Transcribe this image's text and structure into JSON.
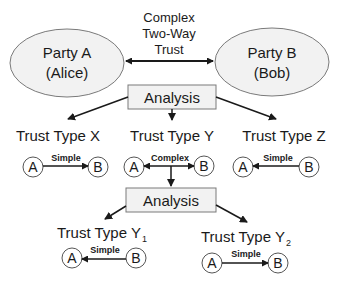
{
  "top": {
    "party_a": {
      "line1": "Party A",
      "line2": "(Alice)"
    },
    "party_b": {
      "line1": "Party B",
      "line2": "(Bob)"
    },
    "relation": {
      "line1": "Complex",
      "line2": "Two-Way",
      "line3": "Trust"
    }
  },
  "analysis_1": {
    "label": "Analysis"
  },
  "types": [
    {
      "title": "Trust Type X",
      "node_a": "A",
      "node_b": "B",
      "edge_label": "Simple",
      "direction": "A-to-B"
    },
    {
      "title": "Trust Type Y",
      "node_a": "A",
      "node_b": "B",
      "edge_label": "Complex",
      "direction": "bidirectional"
    },
    {
      "title": "Trust Type Z",
      "node_a": "A",
      "node_b": "B",
      "edge_label": "Simple",
      "direction": "B-to-A"
    }
  ],
  "analysis_2": {
    "label": "Analysis"
  },
  "subtypes": [
    {
      "title": "Trust Type Y",
      "subscript": "1",
      "node_a": "A",
      "node_b": "B",
      "edge_label": "Simple",
      "direction": "B-to-A"
    },
    {
      "title": "Trust Type Y",
      "subscript": "2",
      "node_a": "A",
      "node_b": "B",
      "edge_label": "Simple",
      "direction": "A-to-B"
    }
  ],
  "colors": {
    "stroke": "#1a1a1a",
    "shape_fill": "#f2f2f2",
    "shape_stroke": "#7a7a7a"
  }
}
